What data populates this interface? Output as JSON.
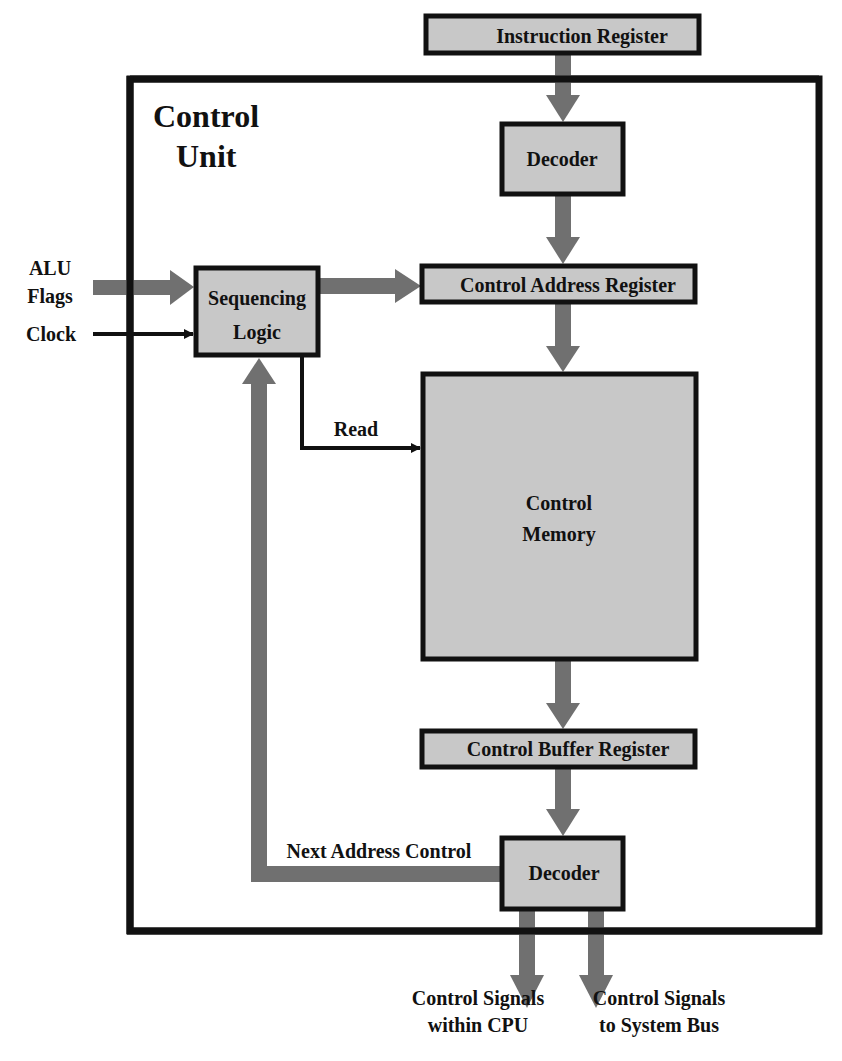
{
  "diagram": {
    "title_line1": "Control",
    "title_line2": "Unit",
    "colors": {
      "box_fill": "#c8c8c8",
      "border": "#111111",
      "thick_arrow": "#707070",
      "thin_arrow": "#111111",
      "background": "#ffffff"
    },
    "blocks": {
      "instruction_register": "Instruction Register",
      "decoder_top": "Decoder",
      "control_address_register": "Control Address Register",
      "sequencing_logic_line1": "Sequencing",
      "sequencing_logic_line2": "Logic",
      "control_memory_line1": "Control",
      "control_memory_line2": "Memory",
      "control_buffer_register": "Control Buffer Register",
      "decoder_bottom": "Decoder"
    },
    "inputs": {
      "alu_flags_line1": "ALU",
      "alu_flags_line2": "Flags",
      "clock": "Clock"
    },
    "edge_labels": {
      "read": "Read",
      "next_address_control": "Next Address Control"
    },
    "outputs": {
      "within_cpu_line1": "Control Signals",
      "within_cpu_line2": "within CPU",
      "system_bus_line1": "Control Signals",
      "system_bus_line2": "to System Bus"
    }
  }
}
